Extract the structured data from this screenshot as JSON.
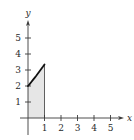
{
  "chart_data": {
    "type": "area",
    "title": "",
    "xlabel": "x",
    "ylabel": "y",
    "x_ticks": [
      1,
      2,
      3,
      4,
      5
    ],
    "y_ticks": [
      1,
      2,
      3,
      4,
      5
    ],
    "xlim": [
      -0.5,
      5.8
    ],
    "ylim": [
      -1,
      6.1
    ],
    "grid": false,
    "legend": null,
    "series": [
      {
        "name": "curve",
        "x": [
          0,
          0.1,
          0.2,
          0.3,
          0.4,
          0.5,
          0.6,
          0.7,
          0.8,
          0.9,
          1.0
        ],
        "y": [
          2.0,
          2.12,
          2.25,
          2.38,
          2.51,
          2.64,
          2.78,
          2.92,
          3.06,
          3.2,
          3.35
        ]
      }
    ],
    "shaded_region": {
      "x_from": 0,
      "x_to": 1,
      "lower": 0,
      "upper": "curve",
      "color": "#e6e6e6"
    }
  },
  "layout": {
    "origin_px": [
      28,
      118
    ],
    "unit_x_px": 16.5,
    "unit_y_px": 16.0,
    "x_axis_px": [
      20,
      124
    ],
    "y_axis_px": [
      135,
      20
    ]
  },
  "colors": {
    "axis": "#3a3a3a",
    "curve": "#111111",
    "fill": "#e6e6e6",
    "background": "#ffffff"
  }
}
